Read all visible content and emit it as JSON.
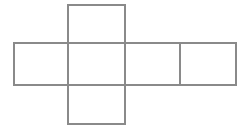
{
  "figure": {
    "background_color": "#ffffff",
    "line_color": "#8a8a8a",
    "line_width": 1.6,
    "canvas": {
      "width": 247,
      "height": 131
    }
  },
  "chart_data": {
    "type": "diagram",
    "shape": "cross",
    "units": "pixels",
    "grid": {
      "cell_width": 56,
      "cell_height": 42,
      "columns_x": [
        14,
        68,
        125,
        180,
        236
      ],
      "rows_y": [
        5,
        43,
        85,
        124
      ]
    },
    "faces": [
      {
        "name": "top-face",
        "row": 0,
        "col": 1,
        "x": 68,
        "y": 5,
        "width": 57,
        "height": 38
      },
      {
        "name": "left-face",
        "row": 1,
        "col": 0,
        "x": 14,
        "y": 43,
        "width": 54,
        "height": 42
      },
      {
        "name": "front-face",
        "row": 1,
        "col": 1,
        "x": 68,
        "y": 43,
        "width": 57,
        "height": 42
      },
      {
        "name": "right-face",
        "row": 1,
        "col": 2,
        "x": 125,
        "y": 43,
        "width": 55,
        "height": 42
      },
      {
        "name": "back-face",
        "row": 1,
        "col": 3,
        "x": 180,
        "y": 43,
        "width": 56,
        "height": 42
      },
      {
        "name": "bottom-face",
        "row": 2,
        "col": 1,
        "x": 68,
        "y": 85,
        "width": 57,
        "height": 39
      }
    ],
    "edges": [
      {
        "name": "horizontal-strip-top",
        "orientation": "horizontal",
        "x1": 14,
        "y1": 43,
        "x2": 236,
        "y2": 43
      },
      {
        "name": "horizontal-strip-bottom",
        "orientation": "horizontal",
        "x1": 14,
        "y1": 85,
        "x2": 236,
        "y2": 85
      },
      {
        "name": "vertical-strip-top",
        "orientation": "horizontal",
        "x1": 68,
        "y1": 5,
        "x2": 125,
        "y2": 5
      },
      {
        "name": "vertical-strip-bottom",
        "orientation": "horizontal",
        "x1": 68,
        "y1": 124,
        "x2": 125,
        "y2": 124
      },
      {
        "name": "strip-left-end",
        "orientation": "vertical",
        "x1": 14,
        "y1": 43,
        "x2": 14,
        "y2": 85
      },
      {
        "name": "strip-right-end",
        "orientation": "vertical",
        "x1": 236,
        "y1": 43,
        "x2": 236,
        "y2": 85
      },
      {
        "name": "divider-left",
        "orientation": "vertical",
        "x1": 68,
        "y1": 5,
        "x2": 68,
        "y2": 124
      },
      {
        "name": "divider-center",
        "orientation": "vertical",
        "x1": 125,
        "y1": 5,
        "x2": 125,
        "y2": 124
      },
      {
        "name": "divider-right",
        "orientation": "vertical",
        "x1": 180,
        "y1": 43,
        "x2": 180,
        "y2": 85
      }
    ],
    "face_count": 6,
    "labels": []
  }
}
